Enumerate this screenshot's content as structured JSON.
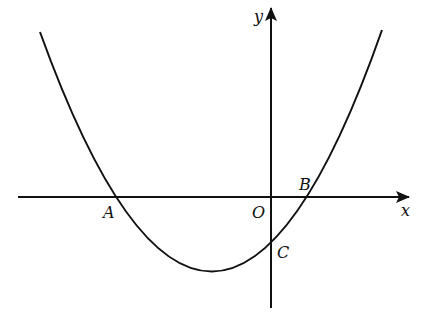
{
  "diagram": {
    "type": "parabola-on-axes",
    "axes": {
      "x_label": "x",
      "y_label": "y",
      "origin_label": "O"
    },
    "points": [
      {
        "id": "A",
        "label": "A",
        "role": "left x-intercept"
      },
      {
        "id": "B",
        "label": "B",
        "role": "right x-intercept"
      },
      {
        "id": "C",
        "label": "C",
        "role": "y-intercept"
      }
    ],
    "colors": {
      "stroke": "#111111",
      "background": "#ffffff"
    }
  }
}
